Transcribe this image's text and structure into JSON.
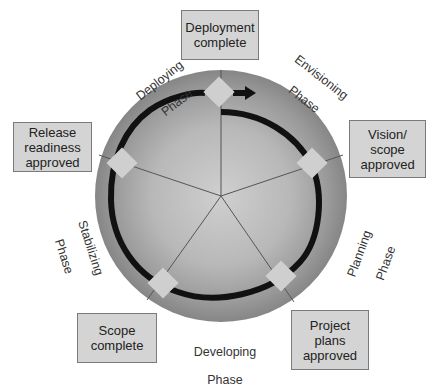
{
  "diagram": {
    "type": "cycle",
    "center": {
      "x": 221,
      "y": 196
    },
    "radius": 126,
    "colors": {
      "disc_outer": "#8c8c8c",
      "disc_inner": "#c9c9c9",
      "arrow": "#111111",
      "diamond": "#cfcfcf",
      "box_fill": "#d4d4d4",
      "box_border": "#7a7a7a",
      "divider": "#555555"
    },
    "phases": [
      {
        "id": "envisioning",
        "line1": "Envisioning",
        "line2": "Phase"
      },
      {
        "id": "planning",
        "line1": "Planning",
        "line2": "Phase"
      },
      {
        "id": "developing",
        "line1": "Developing",
        "line2": "Phase"
      },
      {
        "id": "stabilizing",
        "line1": "Stabilizing",
        "line2": "Phase"
      },
      {
        "id": "deploying",
        "line1": "Deploying",
        "line2": "Phase"
      }
    ],
    "milestones": [
      {
        "id": "deployment-complete",
        "text": "Deployment complete"
      },
      {
        "id": "vision-scope-approved",
        "text": "Vision/ scope approved"
      },
      {
        "id": "project-plans-approved",
        "text": "Project plans approved"
      },
      {
        "id": "scope-complete",
        "text": "Scope complete"
      },
      {
        "id": "release-readiness-approved",
        "text": "Release readiness approved"
      }
    ]
  }
}
